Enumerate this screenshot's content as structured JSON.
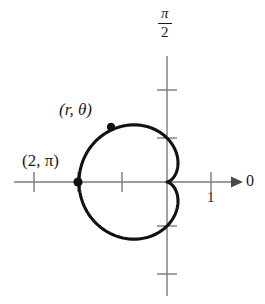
{
  "figure": {
    "kind": "polar-graph",
    "background_color": "#ffffff",
    "axis_color": "#7a7a7a",
    "curve_color": "#111111",
    "text_color": "#1a1a1a"
  },
  "axes": {
    "polar_axis_label": "0",
    "vertical_axis_label_numerator": "π",
    "vertical_axis_label_denominator": "2",
    "origin": {
      "x": 167,
      "y": 182
    },
    "unit_px": 44,
    "horizontal_ticks": [
      {
        "label": "",
        "x": 34
      },
      {
        "label": "",
        "x": 78
      },
      {
        "label": "",
        "x": 122
      },
      {
        "label": "1",
        "x": 211
      }
    ],
    "vertical_ticks": [
      {
        "label": "",
        "y": 90
      },
      {
        "label": "",
        "y": 138
      },
      {
        "label": "",
        "y": 226
      },
      {
        "label": "",
        "y": 274
      }
    ],
    "tick_one_label": "1"
  },
  "annotations": {
    "point_rtheta": {
      "label": "(r, θ)",
      "marker_x": 111,
      "marker_y": 127
    },
    "point_two_pi": {
      "label": "(2, π)",
      "marker_x": 78,
      "marker_y": 182
    }
  },
  "chart_data": {
    "type": "line",
    "title": "",
    "subtitle": "",
    "plot_kind": "polar-cardioid",
    "equation": "r = 1 - cos(θ)",
    "scale_a": 1,
    "max_radius": 2,
    "xlabel": "0",
    "ylabel": "π/2",
    "grid": false,
    "legend": null,
    "xlim": [
      -3.0,
      2.2
    ],
    "ylim": [
      -2.7,
      2.7
    ],
    "axis_tick_values_x": [
      -3,
      -2,
      -1,
      1
    ],
    "axis_tick_values_y": [
      2,
      1,
      -1,
      -2
    ],
    "labeled_ticks": {
      "x": {
        "1": "1"
      },
      "y": {}
    },
    "annotations": [
      {
        "text": "(r, θ)",
        "r": 2.0,
        "theta_deg": 120,
        "x": -1.0,
        "y": 1.73
      },
      {
        "text": "(2, π)",
        "r": 2.0,
        "theta_deg": 180,
        "x": -2.0,
        "y": 0.0
      }
    ],
    "series": [
      {
        "name": "cardioid",
        "polar_equation": "r = 1 - cos(θ)",
        "theta_deg": [
          0,
          15,
          30,
          45,
          60,
          75,
          90,
          105,
          120,
          135,
          150,
          165,
          180,
          195,
          210,
          225,
          240,
          255,
          270,
          285,
          300,
          315,
          330,
          345,
          360
        ],
        "r": [
          0.0,
          0.068,
          0.268,
          0.586,
          1.0,
          1.482,
          2.0,
          2.518,
          3.0,
          3.414,
          3.732,
          3.932,
          4.0,
          3.932,
          3.732,
          3.414,
          3.0,
          2.518,
          2.0,
          1.482,
          1.0,
          0.586,
          0.268,
          0.068,
          0.0
        ],
        "r_scaled": [
          0.0,
          0.034,
          0.134,
          0.293,
          0.5,
          0.741,
          1.0,
          1.259,
          1.5,
          1.707,
          1.866,
          1.966,
          2.0,
          1.966,
          1.866,
          1.707,
          1.5,
          1.259,
          1.0,
          0.741,
          0.5,
          0.293,
          0.134,
          0.034,
          0.0
        ]
      }
    ]
  }
}
